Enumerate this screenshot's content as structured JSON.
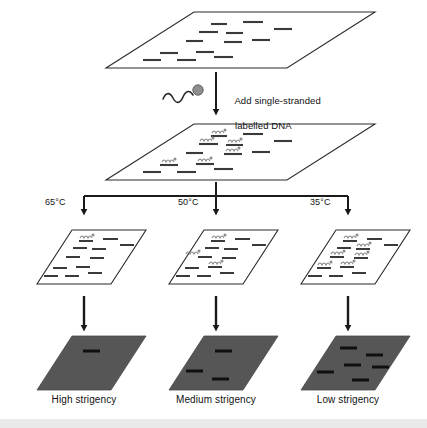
{
  "figure": {
    "background_color": "#ffffff",
    "line_color": "#1a1a1a",
    "membrane_fill": "#ffffff",
    "autorad_fill": "#565656",
    "autorad_band_color": "#101010",
    "band_color": "#3a3a3a"
  },
  "step_label": {
    "line1": "Add single-stranded",
    "line2": "labelled DNA"
  },
  "probe_icon": {
    "name": "labelled-dna-probe",
    "description": "wavy single strand with filled label dot"
  },
  "membranes": {
    "top": {
      "name": "blot-membrane-unhybridized",
      "band_count": 12
    },
    "hybridized": {
      "name": "blot-membrane-hybridized",
      "band_count": 12,
      "probe_count": 6
    }
  },
  "branches": [
    {
      "id": "high",
      "temperature": "65°C",
      "result_label": "High strigency",
      "probe_count": 1,
      "band_count": 12,
      "signal_bands": 1
    },
    {
      "id": "medium",
      "temperature": "50°C",
      "result_label": "Medium strigency",
      "probe_count": 3,
      "band_count": 12,
      "signal_bands": 3
    },
    {
      "id": "low",
      "temperature": "35°C",
      "result_label": "Low strigency",
      "probe_count": 6,
      "band_count": 12,
      "signal_bands": 6
    }
  ]
}
